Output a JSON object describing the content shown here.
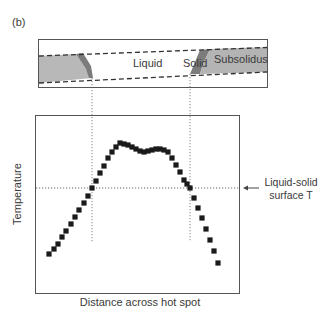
{
  "figure": {
    "panel_label": "(b)",
    "cross_section": {
      "labels": {
        "liquid": "Liquid",
        "solid": "Solid",
        "subsolidus": "Subsolidus"
      },
      "colors": {
        "subsolidus_fill": "#b4b4b4",
        "solid_fill": "#7a7a7a",
        "liquid_fill": "#ffffff",
        "border": "#444444"
      }
    },
    "plot": {
      "xlabel": "Distance across hot spot",
      "ylabel": "Temperature",
      "annotation": "Liquid-solid surface T",
      "annotation_line1": "Liquid-solid",
      "annotation_line2": "surface T",
      "marker_color": "#1a1a1a"
    }
  },
  "chart_data": {
    "type": "scatter",
    "title": "",
    "xlabel": "Distance across hot spot",
    "ylabel": "Temperature",
    "grid": false,
    "note": "Pixel-space positions (x right, y down) within a 328x328 frame; no numeric axis ticks are shown.",
    "reference_lines": {
      "horizontal_liquid_solid_surface_T_y": 188,
      "vertical_left_boundary_x": 92,
      "vertical_right_boundary_x": 190
    },
    "points": [
      [
        49,
        254
      ],
      [
        54,
        249
      ],
      [
        58,
        244
      ],
      [
        62,
        237
      ],
      [
        66,
        231
      ],
      [
        71,
        224
      ],
      [
        75,
        217
      ],
      [
        79,
        210
      ],
      [
        84,
        203
      ],
      [
        88,
        196
      ],
      [
        92,
        188
      ],
      [
        96,
        181
      ],
      [
        100,
        173
      ],
      [
        104,
        166
      ],
      [
        108,
        158
      ],
      [
        112,
        152
      ],
      [
        116,
        147
      ],
      [
        120,
        143
      ],
      [
        124,
        144
      ],
      [
        128,
        145
      ],
      [
        132,
        147
      ],
      [
        136,
        149
      ],
      [
        140,
        151
      ],
      [
        144,
        152
      ],
      [
        148,
        151
      ],
      [
        152,
        150
      ],
      [
        156,
        149
      ],
      [
        160,
        149
      ],
      [
        164,
        150
      ],
      [
        168,
        152
      ],
      [
        172,
        158
      ],
      [
        176,
        165
      ],
      [
        180,
        172
      ],
      [
        184,
        180
      ],
      [
        187,
        184
      ],
      [
        190,
        188
      ],
      [
        194,
        198
      ],
      [
        198,
        208
      ],
      [
        202,
        218
      ],
      [
        206,
        229
      ],
      [
        210,
        240
      ],
      [
        214,
        251
      ],
      [
        218,
        263
      ]
    ]
  }
}
